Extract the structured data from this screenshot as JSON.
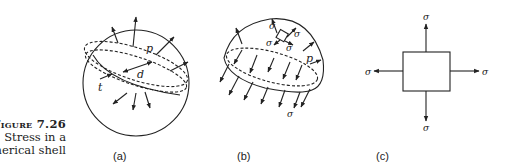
{
  "figure": {
    "number_label": "Figure 7.26",
    "caption_line1": "Stress in a",
    "caption_line2": "spherical shell"
  },
  "panels": [
    {
      "id": "a",
      "label": "(a)",
      "annotations": {
        "pressure": "p",
        "diameter": "d",
        "thickness": "t"
      }
    },
    {
      "id": "b",
      "label": "(b)",
      "annotations": {
        "pressure": "p",
        "stress": "σ"
      }
    },
    {
      "id": "c",
      "label": "(c)",
      "annotations": {
        "stress": "σ"
      }
    }
  ]
}
